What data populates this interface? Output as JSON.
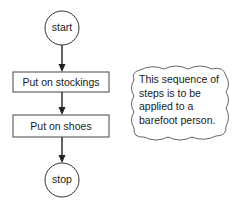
{
  "diagram": {
    "type": "flowchart",
    "nodes": [
      {
        "id": "start",
        "shape": "circle",
        "label": "start"
      },
      {
        "id": "step1",
        "shape": "rectangle",
        "label": "Put on stockings"
      },
      {
        "id": "step2",
        "shape": "rectangle",
        "label": "Put on shoes"
      },
      {
        "id": "stop",
        "shape": "circle",
        "label": "stop"
      }
    ],
    "edges": [
      {
        "from": "start",
        "to": "step1"
      },
      {
        "from": "step1",
        "to": "step2"
      },
      {
        "from": "step2",
        "to": "stop"
      }
    ],
    "annotation": {
      "shape": "cloud",
      "lines": [
        "This sequence of",
        "steps is to be",
        "applied to a",
        "barefoot person."
      ]
    }
  },
  "colors": {
    "stroke": "#222222",
    "background": "#ffffff"
  }
}
